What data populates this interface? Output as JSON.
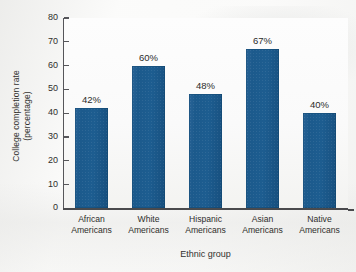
{
  "chart_data": {
    "type": "bar",
    "title": "",
    "xlabel": "Ethnic group",
    "ylabel": "College completion rate (percentage)",
    "ylabel_line1": "College completion rate",
    "ylabel_line2": "(percentage)",
    "categories": [
      "African Americans",
      "White Americans",
      "Hispanic Americans",
      "Asian Americans",
      "Native Americans"
    ],
    "category_lines": [
      {
        "line1": "African",
        "line2": "Americans"
      },
      {
        "line1": "White",
        "line2": "Americans"
      },
      {
        "line1": "Hispanic",
        "line2": "Americans"
      },
      {
        "line1": "Asian",
        "line2": "Americans"
      },
      {
        "line1": "Native",
        "line2": "Americans"
      }
    ],
    "values": [
      42,
      60,
      48,
      67,
      40
    ],
    "value_labels": [
      "42%",
      "60%",
      "48%",
      "67%",
      "40%"
    ],
    "ylim": [
      0,
      80
    ],
    "ytick_values": [
      0,
      10,
      20,
      30,
      40,
      50,
      60,
      70,
      80
    ],
    "ytick_labels": [
      "0",
      "10",
      "20",
      "30",
      "40",
      "50",
      "60",
      "70",
      "80"
    ],
    "grid": false,
    "legend": false,
    "legend_position": "none",
    "bar_color": "#1d5b8e",
    "axis_color": "#4a4a4d",
    "text_color": "#2e2e2c",
    "background_color": "#fbfbfa"
  }
}
